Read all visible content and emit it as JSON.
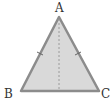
{
  "diagram": {
    "type": "isosceles-triangle",
    "vertices": {
      "A": {
        "label": "A",
        "x": 59,
        "y": 17
      },
      "B": {
        "label": "B",
        "x": 21,
        "y": 91
      },
      "C": {
        "label": "C",
        "x": 99,
        "y": 91
      }
    },
    "altitude": {
      "from": "A",
      "to_midpoint_of": "BC",
      "style": "dashed"
    },
    "congruence_marks": [
      "AB",
      "AC"
    ],
    "colors": {
      "fill": "#d9d9d9",
      "stroke": "#8c8c8c",
      "altitude": "#9a9a9a",
      "label": "#333333"
    }
  }
}
